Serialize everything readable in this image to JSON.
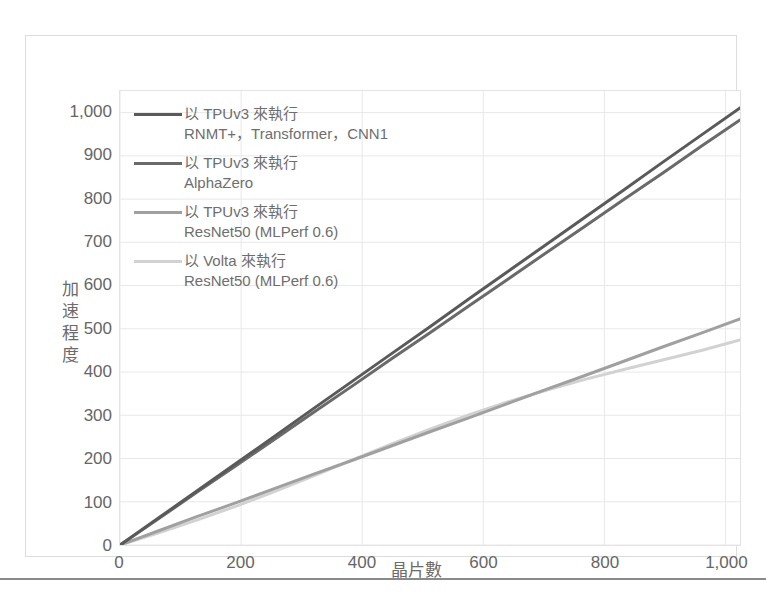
{
  "chart_data": {
    "type": "line",
    "title": "",
    "xlabel": "晶片數",
    "ylabel": "加速程度",
    "xlim": [
      0,
      1024
    ],
    "ylim": [
      0,
      1050
    ],
    "grid": true,
    "legend_position": "top-left-inside",
    "x_ticks": [
      "0",
      "200",
      "400",
      "600",
      "800",
      "1,000"
    ],
    "x_tick_values": [
      0,
      200,
      400,
      600,
      800,
      1000
    ],
    "y_ticks": [
      "0",
      "100",
      "200",
      "300",
      "400",
      "500",
      "600",
      "700",
      "800",
      "900",
      "1,000"
    ],
    "y_tick_values": [
      0,
      100,
      200,
      300,
      400,
      500,
      600,
      700,
      800,
      900,
      1000
    ],
    "x": [
      0,
      64,
      128,
      192,
      256,
      320,
      384,
      448,
      512,
      576,
      640,
      704,
      768,
      832,
      896,
      960,
      1024
    ],
    "series": [
      {
        "name": "以 TPUv3 來執行 RNMT+、Transformer、CNN1",
        "label_line1": "以 TPUv3 來執行",
        "label_line2": "RNMT+，Transformer，CNN1",
        "color": "#5a5a5a",
        "width": 3,
        "values": [
          0,
          63,
          126,
          189,
          252,
          316,
          379,
          442,
          505,
          569,
          632,
          695,
          758,
          821,
          885,
          948,
          1011
        ]
      },
      {
        "name": "以 TPUv3 來執行 AlphaZero",
        "label_line1": "以 TPUv3 來執行",
        "label_line2": "AlphaZero",
        "color": "#6a6a6a",
        "width": 3,
        "values": [
          0,
          61,
          123,
          184,
          245,
          307,
          368,
          430,
          491,
          553,
          614,
          676,
          737,
          799,
          860,
          922,
          983
        ]
      },
      {
        "name": "以 TPUv3 來執行 ResNet50 (MLPerf 0.6)",
        "label_line1": "以 TPUv3 來執行",
        "label_line2": "ResNet50 (MLPerf 0.6)",
        "color": "#a0a0a0",
        "width": 3,
        "values": [
          0,
          33,
          66,
          98,
          131,
          164,
          196,
          229,
          262,
          294,
          327,
          360,
          392,
          425,
          458,
          490,
          523
        ]
      },
      {
        "name": "以 Volta 來執行 ResNet50 (MLPerf 0.6)",
        "label_line1": "以 Volta 來執行",
        "label_line2": "ResNet50 (MLPerf 0.6)",
        "color": "#d2d2d2",
        "width": 3,
        "values": [
          0,
          28,
          58,
          90,
          124,
          160,
          197,
          233,
          268,
          301,
          331,
          358,
          383,
          406,
          428,
          450,
          474
        ]
      }
    ]
  },
  "axes": {
    "y_title": "加速程度",
    "x_title": "晶片數"
  }
}
